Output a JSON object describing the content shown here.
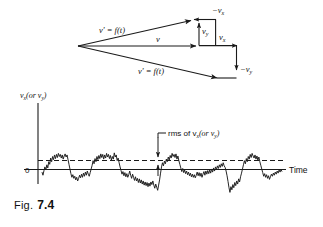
{
  "figure": {
    "caption_prefix": "Fig.",
    "caption_number": "7.4"
  },
  "vector_diagram": {
    "labels": {
      "upper_resultant": "v' = f(t)",
      "lower_resultant": "v' = f(t)",
      "mean_vector": "v",
      "neg_vx": "−v",
      "neg_vx_sub": "x",
      "vy": "v",
      "vy_sub": "y",
      "vx": "v",
      "vx_sub": "x",
      "neg_vy": "−v",
      "neg_vy_sub": "y"
    }
  },
  "plot": {
    "y_axis_label_main": "v",
    "y_axis_label_sub": "x",
    "y_axis_label_rest": "(or v",
    "y_axis_label_sub2": "y",
    "y_axis_label_close": ")",
    "zero_label": "0",
    "x_axis_label": "Time",
    "annotation_main": "rms of v",
    "annotation_sub": "x",
    "annotation_rest": "(or v",
    "annotation_sub2": "y",
    "annotation_close": ")"
  },
  "chart_data": {
    "type": "line",
    "title": "",
    "xlabel": "Time",
    "ylabel": "v_x (or v_y)",
    "ylim": [
      -1.0,
      1.0
    ],
    "xlim": [
      0,
      240
    ],
    "grid": false,
    "legend": null,
    "annotations": [
      {
        "text": "rms of v_x (or v_y)",
        "type": "dashed-reference-line",
        "y": 0.27
      },
      {
        "text": "0",
        "type": "axis-origin-tick",
        "y": 0
      }
    ],
    "series": [
      {
        "name": "v_x (or v_y) noise trace",
        "values": [
          -0.1,
          -0.22,
          -0.05,
          0.1,
          -0.02,
          0.18,
          0.06,
          0.3,
          0.2,
          0.44,
          0.3,
          0.5,
          0.38,
          0.56,
          0.42,
          0.58,
          0.46,
          0.62,
          0.5,
          0.58,
          0.44,
          0.56,
          0.4,
          0.52,
          0.6,
          0.48,
          0.56,
          0.38,
          0.2,
          0.02,
          -0.16,
          -0.3,
          -0.2,
          -0.34,
          -0.26,
          -0.4,
          -0.3,
          -0.44,
          -0.34,
          -0.22,
          -0.32,
          -0.18,
          -0.3,
          -0.14,
          -0.26,
          -0.1,
          -0.22,
          -0.06,
          -0.18,
          -0.26,
          -0.12,
          0.02,
          0.16,
          0.34,
          0.22,
          0.42,
          0.3,
          0.5,
          0.38,
          0.54,
          0.42,
          0.6,
          0.46,
          0.58,
          0.4,
          0.56,
          0.44,
          0.62,
          0.48,
          0.58,
          0.42,
          0.54,
          0.36,
          0.5,
          0.4,
          0.64,
          0.48,
          0.56,
          0.34,
          0.44,
          0.26,
          0.1,
          -0.04,
          -0.18,
          -0.08,
          -0.24,
          -0.12,
          -0.28,
          -0.16,
          -0.3,
          -0.2,
          -0.06,
          -0.22,
          -0.34,
          -0.18,
          -0.3,
          -0.42,
          -0.28,
          -0.44,
          -0.34,
          -0.5,
          -0.36,
          -0.52,
          -0.4,
          -0.56,
          -0.44,
          -0.6,
          -0.48,
          -0.62,
          -0.5,
          -0.66,
          -0.52,
          -0.64,
          -0.48,
          -0.58,
          -0.44,
          -0.6,
          -0.72,
          -0.56,
          -0.68,
          -0.8,
          -0.6,
          -0.4,
          -0.14,
          0.1,
          0.26,
          0.14,
          0.32,
          0.22,
          0.4,
          0.3,
          0.48,
          0.36,
          0.54,
          0.44,
          0.62,
          0.5,
          0.58,
          0.46,
          0.6,
          0.4,
          0.52,
          0.34,
          0.2,
          0.06,
          -0.08,
          0.04,
          -0.12,
          -0.02,
          -0.16,
          -0.06,
          -0.2,
          -0.1,
          -0.24,
          -0.14,
          -0.28,
          -0.18,
          -0.3,
          -0.2,
          -0.32,
          -0.22,
          -0.1,
          -0.24,
          -0.12,
          -0.26,
          -0.14,
          -0.3,
          -0.18,
          -0.08,
          -0.22,
          -0.06,
          -0.18,
          -0.04,
          -0.16,
          -0.02,
          -0.14,
          0.02,
          -0.1,
          0.06,
          -0.06,
          0.1,
          0.0,
          0.14,
          0.04,
          0.18,
          0.08,
          0.22,
          0.12,
          0.26,
          0.14,
          0.08,
          -0.06,
          -0.24,
          -0.46,
          -0.7,
          -0.88,
          -0.66,
          -0.78,
          -0.58,
          -0.7,
          -0.5,
          -0.62,
          -0.44,
          -0.56,
          -0.36,
          -0.48,
          -0.28,
          -0.14,
          0.02,
          0.18,
          0.34,
          0.22,
          0.42,
          0.3,
          0.5,
          0.4,
          0.58,
          0.46,
          0.62,
          0.52,
          0.44,
          0.56,
          0.4,
          0.52,
          0.36,
          0.48,
          0.3,
          0.16,
          0.02,
          -0.12,
          -0.26,
          -0.16,
          -0.3,
          -0.2,
          -0.34,
          -0.24,
          -0.38,
          -0.28,
          -0.18,
          -0.26,
          -0.14,
          -0.22,
          -0.1,
          -0.18,
          -0.06,
          -0.14,
          -0.02,
          -0.1,
          0.0,
          -0.08
        ]
      }
    ]
  }
}
